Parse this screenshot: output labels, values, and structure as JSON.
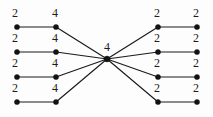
{
  "figure": {
    "kind": "graph-diagram",
    "width": 213,
    "height": 117,
    "background_color": "#fdfdfd",
    "edge_color": "#1a1a1a",
    "vertex_color": "#121212",
    "label_color": "#1b1b1b"
  },
  "chart_data": {
    "type": "diagram",
    "subtype": "vertex-labeled-graph",
    "title": "",
    "vertex_label_values": [
      2,
      4,
      2,
      2
    ],
    "vertices": [
      {
        "id": "L1-outer",
        "label": "2",
        "x": 17,
        "y": 27,
        "label_x": 15,
        "label_y": 13
      },
      {
        "id": "L1-inner",
        "label": "4",
        "x": 56,
        "y": 27,
        "label_x": 55,
        "label_y": 13
      },
      {
        "id": "L2-outer",
        "label": "2",
        "x": 17,
        "y": 52,
        "label_x": 15,
        "label_y": 38
      },
      {
        "id": "L2-inner",
        "label": "4",
        "x": 56,
        "y": 52,
        "label_x": 55,
        "label_y": 38
      },
      {
        "id": "L3-outer",
        "label": "2",
        "x": 17,
        "y": 77,
        "label_x": 15,
        "label_y": 63
      },
      {
        "id": "L3-inner",
        "label": "4",
        "x": 56,
        "y": 77,
        "label_x": 55,
        "label_y": 63
      },
      {
        "id": "L4-outer",
        "label": "2",
        "x": 17,
        "y": 102,
        "label_x": 15,
        "label_y": 88
      },
      {
        "id": "L4-inner",
        "label": "4",
        "x": 56,
        "y": 102,
        "label_x": 55,
        "label_y": 88
      },
      {
        "id": "center",
        "label": "4",
        "x": 107,
        "y": 59,
        "label_x": 107,
        "label_y": 47
      },
      {
        "id": "R1-inner",
        "label": "2",
        "x": 158,
        "y": 27,
        "label_x": 157,
        "label_y": 13
      },
      {
        "id": "R1-outer",
        "label": "2",
        "x": 197,
        "y": 27,
        "label_x": 196,
        "label_y": 13
      },
      {
        "id": "R2-inner",
        "label": "2",
        "x": 158,
        "y": 52,
        "label_x": 157,
        "label_y": 38
      },
      {
        "id": "R2-outer",
        "label": "2",
        "x": 197,
        "y": 52,
        "label_x": 196,
        "label_y": 38
      },
      {
        "id": "R3-inner",
        "label": "2",
        "x": 158,
        "y": 77,
        "label_x": 157,
        "label_y": 63
      },
      {
        "id": "R3-outer",
        "label": "2",
        "x": 197,
        "y": 77,
        "label_x": 196,
        "label_y": 63
      },
      {
        "id": "R4-inner",
        "label": "2",
        "x": 158,
        "y": 102,
        "label_x": 157,
        "label_y": 88
      },
      {
        "id": "R4-outer",
        "label": "2",
        "x": 197,
        "y": 102,
        "label_x": 196,
        "label_y": 88
      }
    ],
    "edges": [
      {
        "from": "L1-outer",
        "to": "L1-inner"
      },
      {
        "from": "L2-outer",
        "to": "L2-inner"
      },
      {
        "from": "L3-outer",
        "to": "L3-inner"
      },
      {
        "from": "L4-outer",
        "to": "L4-inner"
      },
      {
        "from": "L1-inner",
        "to": "center"
      },
      {
        "from": "L2-inner",
        "to": "center"
      },
      {
        "from": "L3-inner",
        "to": "center"
      },
      {
        "from": "L4-inner",
        "to": "center"
      },
      {
        "from": "center",
        "to": "R1-inner"
      },
      {
        "from": "center",
        "to": "R2-inner"
      },
      {
        "from": "center",
        "to": "R3-inner"
      },
      {
        "from": "center",
        "to": "R4-inner"
      },
      {
        "from": "R1-inner",
        "to": "R1-outer"
      },
      {
        "from": "R2-inner",
        "to": "R2-outer"
      },
      {
        "from": "R3-inner",
        "to": "R3-outer"
      },
      {
        "from": "R4-inner",
        "to": "R4-outer"
      }
    ],
    "vertex_radius": 2.6,
    "center_vertex_radius": 3.0
  }
}
